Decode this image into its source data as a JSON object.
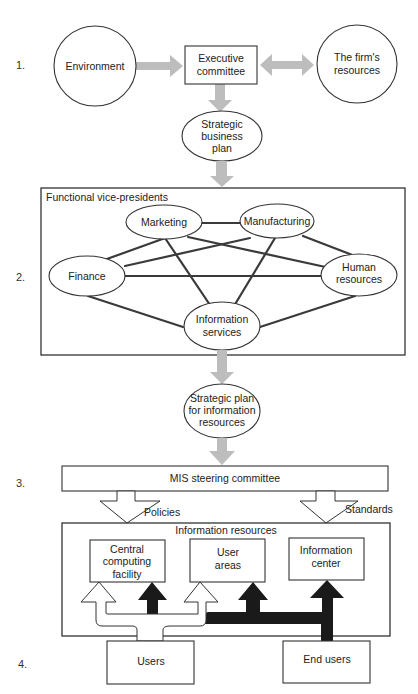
{
  "diagram": {
    "step_numbers": [
      "1.",
      "2.",
      "3.",
      "4."
    ],
    "level1": {
      "environment": "Environment",
      "executive_committee": [
        "Executive",
        "committee"
      ],
      "firms_resources": [
        "The firm's",
        "resources"
      ],
      "strategic_business_plan": [
        "Strategic",
        "business",
        "plan"
      ]
    },
    "level2": {
      "frame_title": "Functional vice-presidents",
      "nodes": {
        "marketing": [
          "Marketing"
        ],
        "manufacturing": [
          "Manufacturing"
        ],
        "finance": [
          "Finance"
        ],
        "human_resources": [
          "Human",
          "resources"
        ],
        "information_services": [
          "Information",
          "services"
        ]
      },
      "strategic_plan_info": [
        "Strategic plan",
        "for information",
        "resources"
      ]
    },
    "level3": {
      "mis_steering_committee": "MIS steering committee",
      "policies": "Policies",
      "standards": "Standards"
    },
    "level4": {
      "frame_title": "Information resources",
      "central_computing_facility": [
        "Central",
        "computing",
        "facility"
      ],
      "user_areas": [
        "User",
        "areas"
      ],
      "information_center": [
        "Information",
        "center"
      ],
      "users": "Users",
      "end_users": "End users"
    },
    "colors": {
      "line": "#333333",
      "gray_arrow": "#bdbdbd",
      "solid_arrow": "#1a1a1a",
      "background": "#ffffff"
    }
  }
}
